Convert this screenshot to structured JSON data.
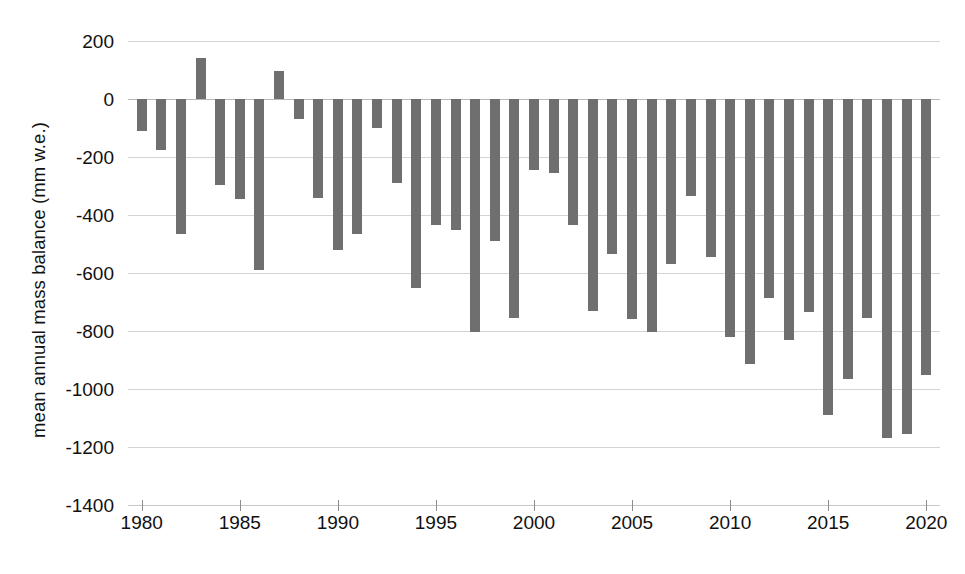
{
  "chart_data": {
    "type": "bar",
    "title": "",
    "xlabel": "",
    "ylabel": "mean annual mass balance (mm w.e.)",
    "ylim": [
      -1400,
      200
    ],
    "xlim": [
      1979.3,
      2020.7
    ],
    "ytick_labels": [
      "200",
      "0",
      "-200",
      "-400",
      "-600",
      "-800",
      "-1000",
      "-1200",
      "-1400"
    ],
    "ytick_values": [
      200,
      0,
      -200,
      -400,
      -600,
      -800,
      -1000,
      -1200,
      -1400
    ],
    "xtick_labels": [
      "1980",
      "1985",
      "1990",
      "1995",
      "2000",
      "2005",
      "2010",
      "2015",
      "2020"
    ],
    "xtick_values": [
      1980,
      1985,
      1990,
      1995,
      2000,
      2005,
      2010,
      2015,
      2020
    ],
    "grid": true,
    "legend": "none",
    "bar_color": "#6f6f6f",
    "categories": [
      1980,
      1981,
      1982,
      1983,
      1984,
      1985,
      1986,
      1987,
      1988,
      1989,
      1990,
      1991,
      1992,
      1993,
      1994,
      1995,
      1996,
      1997,
      1998,
      1999,
      2000,
      2001,
      2002,
      2003,
      2004,
      2005,
      2006,
      2007,
      2008,
      2009,
      2010,
      2011,
      2012,
      2013,
      2014,
      2015,
      2016,
      2017,
      2018,
      2019,
      2020
    ],
    "values": [
      -110,
      -175,
      -465,
      140,
      -295,
      -345,
      -590,
      95,
      -70,
      -340,
      -520,
      -465,
      -100,
      -290,
      -650,
      -435,
      -450,
      -805,
      -490,
      -755,
      -245,
      -255,
      -435,
      -730,
      -535,
      -760,
      -805,
      -570,
      -335,
      -545,
      -820,
      -915,
      -685,
      -830,
      -735,
      -1090,
      -965,
      -755,
      -1170,
      -1155,
      -950
    ]
  }
}
